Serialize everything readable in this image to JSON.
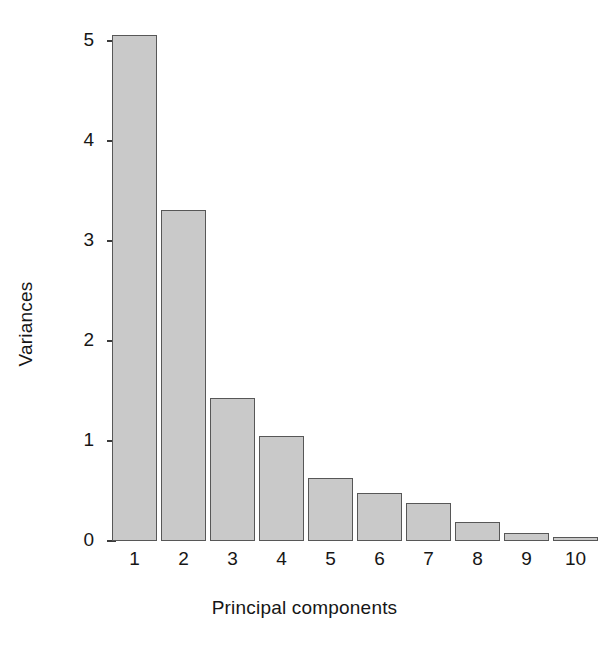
{
  "chart_data": {
    "type": "bar",
    "title": "",
    "subtitle": "",
    "xlabel": "Principal components",
    "ylabel": "Variances",
    "categories": [
      "1",
      "2",
      "3",
      "4",
      "5",
      "6",
      "7",
      "8",
      "9",
      "10"
    ],
    "values": [
      5.06,
      3.31,
      1.43,
      1.05,
      0.63,
      0.48,
      0.38,
      0.19,
      0.08,
      0.02
    ],
    "series": [
      {
        "name": "Variances",
        "values": [
          5.06,
          3.31,
          1.43,
          1.05,
          0.63,
          0.48,
          0.38,
          0.19,
          0.08,
          0.02
        ]
      }
    ],
    "ylim": [
      0,
      5.2
    ],
    "yticks": [
      0,
      1,
      2,
      3,
      4,
      5
    ],
    "ytick_labels": [
      "0",
      "1",
      "2",
      "3",
      "4",
      "5"
    ],
    "xtick_labels": [
      "1",
      "2",
      "3",
      "4",
      "5",
      "6",
      "7",
      "8",
      "9",
      "10"
    ],
    "grid": false,
    "legend": false,
    "legend_position": "none",
    "bar_fill_color": "#c9c9c9",
    "bar_border_color": "#575757",
    "axis_color": "#3c3c3c",
    "background_color": "#ffffff",
    "text_color": "#161616"
  }
}
